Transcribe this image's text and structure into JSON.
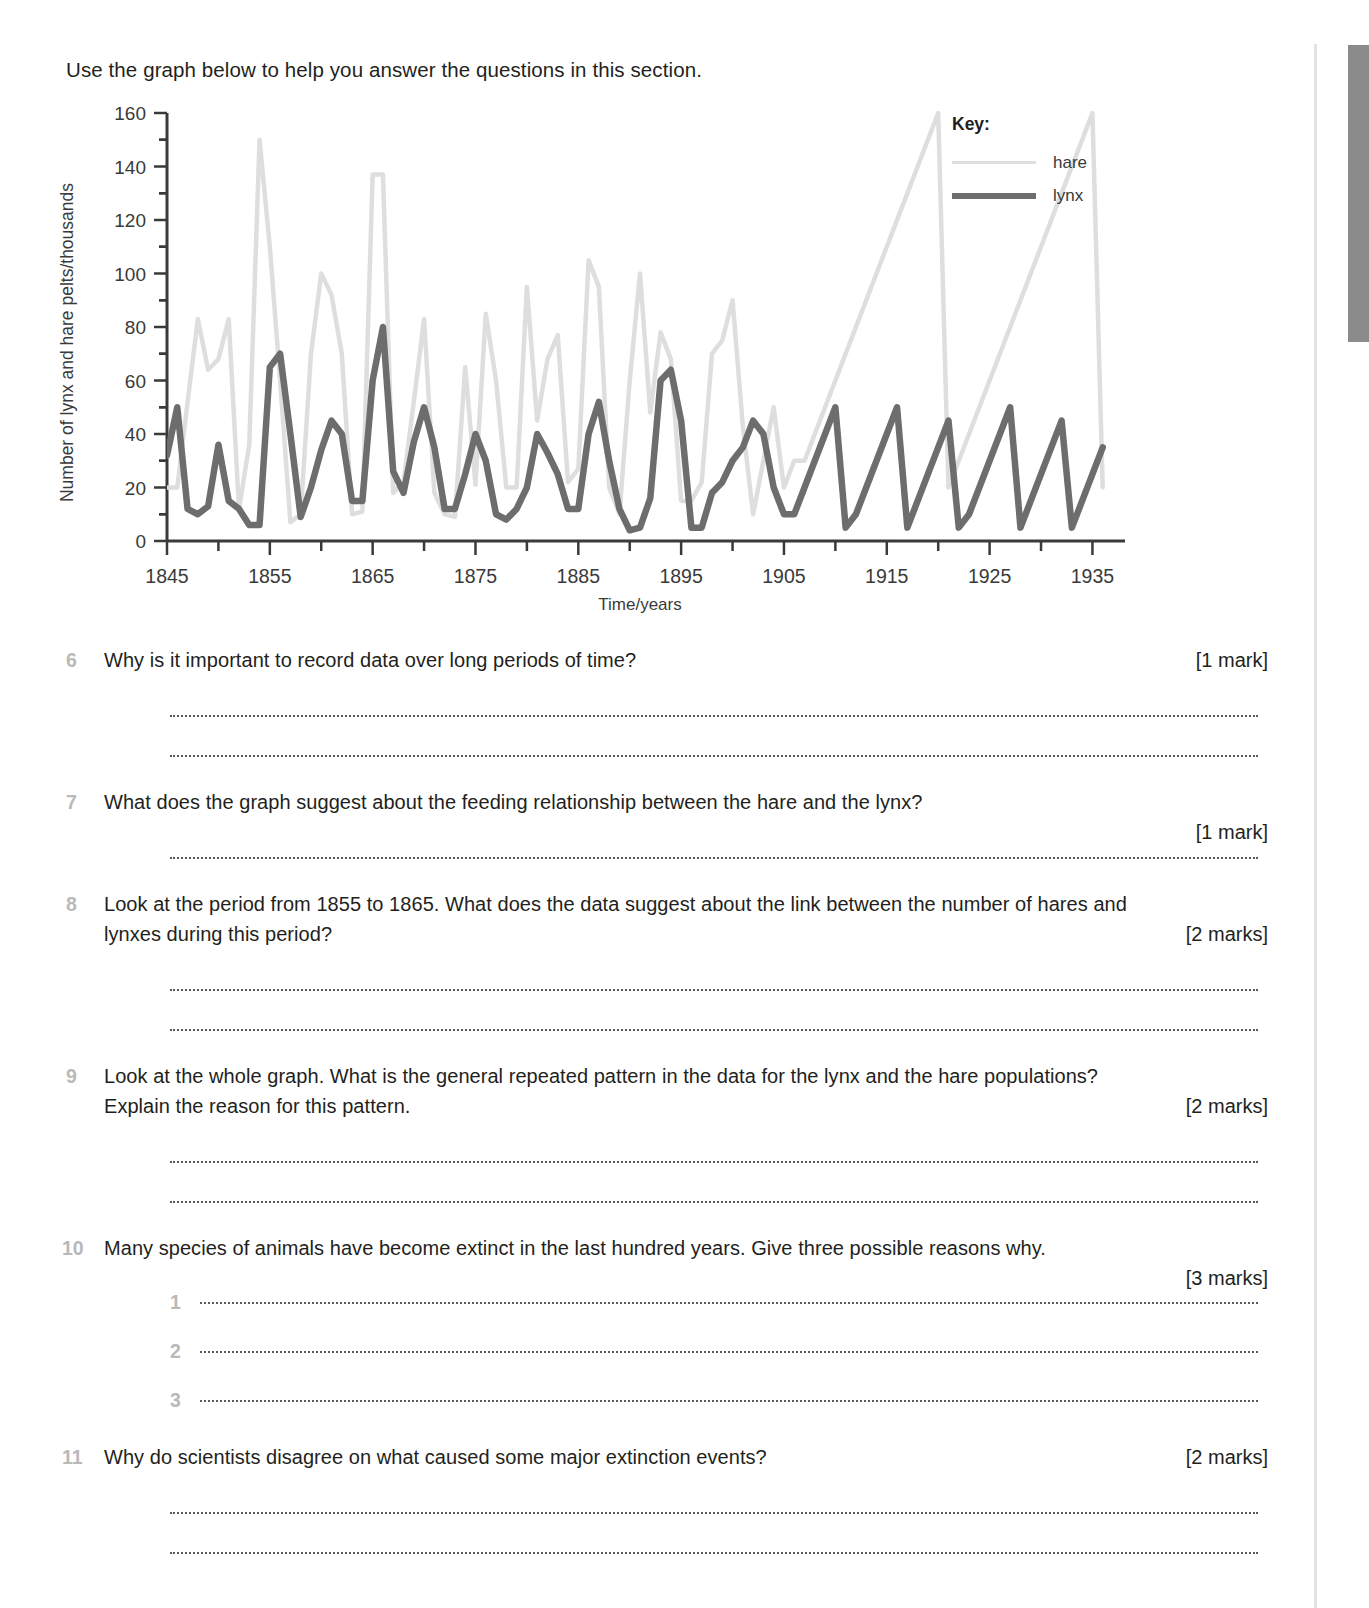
{
  "intro": "Use the graph below to help you answer the questions in this section.",
  "chart_data": {
    "type": "line",
    "title": "",
    "xlabel": "Time/years",
    "ylabel": "Number of lynx and hare pelts/thousands",
    "xlim": [
      1845,
      1937
    ],
    "ylim": [
      0,
      160
    ],
    "x_tick_labels": [
      "1845",
      "1855",
      "1865",
      "1875",
      "1885",
      "1895",
      "1905",
      "1915",
      "1925",
      "1935"
    ],
    "x_tick_values": [
      1845,
      1855,
      1865,
      1875,
      1885,
      1895,
      1905,
      1915,
      1925,
      1935
    ],
    "x_minor_tick_step": 5,
    "y_tick_labels": [
      "0",
      "20",
      "40",
      "60",
      "80",
      "100",
      "120",
      "140",
      "160"
    ],
    "y_tick_values": [
      0,
      20,
      40,
      60,
      80,
      100,
      120,
      140,
      160
    ],
    "y_minor_tick_step": 10,
    "grid": false,
    "legend_position": "top-right",
    "legend_title": "Key:",
    "x": [
      1845,
      1846,
      1847,
      1848,
      1849,
      1850,
      1851,
      1852,
      1853,
      1854,
      1855,
      1856,
      1857,
      1858,
      1859,
      1860,
      1861,
      1862,
      1863,
      1864,
      1865,
      1866,
      1867,
      1868,
      1869,
      1870,
      1871,
      1872,
      1873,
      1874,
      1875,
      1876,
      1877,
      1878,
      1879,
      1880,
      1881,
      1882,
      1883,
      1884,
      1885,
      1886,
      1887,
      1888,
      1889,
      1890,
      1891,
      1892,
      1893,
      1894,
      1895,
      1896,
      1897,
      1898,
      1899,
      1900,
      1901,
      1902,
      1903,
      1904,
      1905,
      1906,
      1907,
      1908,
      1909,
      1910,
      1911,
      1912,
      1913,
      1914,
      1915,
      1916,
      1917,
      1918,
      1919,
      1920,
      1921,
      1922,
      1923,
      1924,
      1925,
      1926,
      1927,
      1928,
      1929,
      1930,
      1931,
      1932,
      1933,
      1934,
      1935,
      1936
    ],
    "series": [
      {
        "name": "hare",
        "color": "#dedede",
        "values": [
          20,
          20,
          52,
          83,
          64,
          68,
          83,
          12,
          36,
          150,
          110,
          60,
          7,
          10,
          70,
          100,
          92,
          70,
          10,
          11,
          137,
          137,
          18,
          22,
          52,
          83,
          18,
          10,
          9,
          65,
          21,
          85,
          60,
          20,
          20,
          95,
          45,
          68,
          77,
          22,
          27,
          105,
          95,
          20,
          10,
          60,
          100,
          48,
          78,
          68,
          15,
          15,
          22,
          70,
          75,
          90,
          43,
          10,
          30,
          50,
          20,
          30,
          30,
          40,
          50,
          60,
          70,
          80,
          90,
          100,
          110,
          120,
          130,
          140,
          150,
          160,
          20,
          30,
          40,
          50,
          60,
          70,
          80,
          90,
          100,
          110,
          120,
          130,
          140,
          150,
          160,
          20
        ]
      },
      {
        "name": "lynx",
        "color": "#6d6d6d",
        "values": [
          32,
          50,
          12,
          10,
          13,
          36,
          15,
          12,
          6,
          6,
          65,
          70,
          40,
          9,
          20,
          34,
          45,
          40,
          15,
          15,
          60,
          80,
          26,
          18,
          37,
          50,
          35,
          12,
          12,
          25,
          40,
          30,
          10,
          8,
          12,
          20,
          40,
          33,
          25,
          12,
          12,
          40,
          52,
          30,
          12,
          4,
          5,
          16,
          60,
          64,
          45,
          5,
          5,
          18,
          22,
          30,
          35,
          45,
          40,
          20,
          10,
          10,
          20,
          30,
          40,
          50,
          5,
          10,
          20,
          30,
          40,
          50,
          5,
          15,
          25,
          35,
          45,
          5,
          10,
          20,
          30,
          40,
          50,
          5,
          15,
          25,
          35,
          45,
          5,
          15,
          25,
          35
        ]
      }
    ]
  },
  "questions": [
    {
      "number": "6",
      "text": "Why is it important to record data over long periods of time?",
      "marks": "[1 mark]",
      "answer_lines": 2
    },
    {
      "number": "7",
      "text": "What does the graph suggest about the feeding relationship between the hare and the lynx?",
      "marks": "[1 mark]",
      "answer_lines": 1
    },
    {
      "number": "8",
      "text": "Look at the period from 1855 to 1865. What does the data suggest about the link between the number of hares and lynxes during this period?",
      "marks": "[2 marks]",
      "answer_lines": 2
    },
    {
      "number": "9",
      "text": "Look at the whole graph. What is the general repeated pattern in the data for the lynx and the hare populations? Explain the reason for this pattern.",
      "marks": "[2 marks]",
      "answer_lines": 2
    },
    {
      "number": "10",
      "text": "Many species of animals have become extinct in the last hundred years. Give three possible reasons why.",
      "marks": "[3 marks]",
      "answer_lines": 0,
      "sub_items": [
        "1",
        "2",
        "3"
      ]
    },
    {
      "number": "11",
      "text": "Why do scientists disagree on what caused some major extinction events?",
      "marks": "[2 marks]",
      "answer_lines": 2
    }
  ]
}
